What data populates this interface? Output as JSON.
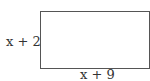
{
  "diagram": {
    "shape": "rectangle",
    "side_label": "x + 2",
    "bottom_label": "x + 9",
    "stroke_color": "#555555"
  }
}
